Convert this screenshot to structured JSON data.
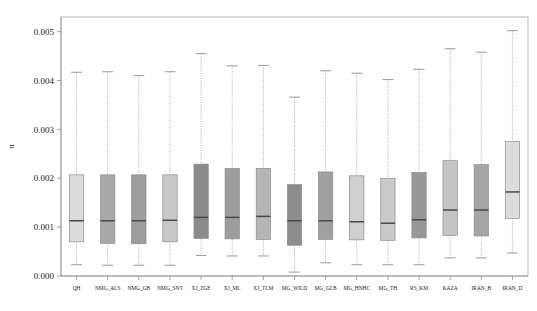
{
  "chart_data": {
    "type": "boxplot",
    "title": "",
    "xlabel": "",
    "ylabel": "π",
    "ylim": [
      0.0,
      0.0053
    ],
    "ytick_labels": [
      "0.000",
      "0.001",
      "0.002",
      "0.003",
      "0.004",
      "0.005"
    ],
    "ytick_values": [
      0.0,
      0.001,
      0.002,
      0.003,
      0.004,
      0.005
    ],
    "grid": false,
    "legend": "none",
    "categories": [
      "QH",
      "NMG_ALS",
      "NMG_GB",
      "NMG_SNT",
      "XJ_ZGE",
      "XJ_ML",
      "XJ_TLM",
      "MG_WILD",
      "MG_GLB",
      "MG_HNHC",
      "MG_TH",
      "RS_KM",
      "KAZA",
      "IRAN_B",
      "IRAN_D"
    ],
    "boxes": [
      {
        "name": "QH",
        "whisker_low": 0.00023,
        "q1": 0.0007,
        "median": 0.00113,
        "q3": 0.00207,
        "whisker_high": 0.00417,
        "fill": "#dcdcdc"
      },
      {
        "name": "NMG_ALS",
        "whisker_low": 0.00022,
        "q1": 0.00067,
        "median": 0.00113,
        "q3": 0.00207,
        "whisker_high": 0.00418,
        "fill": "#a8a8a8"
      },
      {
        "name": "NMG_GB",
        "whisker_low": 0.00022,
        "q1": 0.00066,
        "median": 0.00113,
        "q3": 0.00207,
        "whisker_high": 0.0041,
        "fill": "#9d9d9d"
      },
      {
        "name": "NMG_SNT",
        "whisker_low": 0.00022,
        "q1": 0.0007,
        "median": 0.00114,
        "q3": 0.00207,
        "whisker_high": 0.00418,
        "fill": "#c8c8c8"
      },
      {
        "name": "XJ_ZGE",
        "whisker_low": 0.00042,
        "q1": 0.00077,
        "median": 0.0012,
        "q3": 0.00229,
        "whisker_high": 0.00455,
        "fill": "#8a8a8a"
      },
      {
        "name": "XJ_ML",
        "whisker_low": 0.00041,
        "q1": 0.00076,
        "median": 0.0012,
        "q3": 0.0022,
        "whisker_high": 0.0043,
        "fill": "#9d9d9d"
      },
      {
        "name": "XJ_TLM",
        "whisker_low": 0.00041,
        "q1": 0.00075,
        "median": 0.00122,
        "q3": 0.0022,
        "whisker_high": 0.00431,
        "fill": "#b5b5b5"
      },
      {
        "name": "MG_WILD",
        "whisker_low": 8e-05,
        "q1": 0.00063,
        "median": 0.00113,
        "q3": 0.00187,
        "whisker_high": 0.00366,
        "fill": "#8c8c8c"
      },
      {
        "name": "MG_GLB",
        "whisker_low": 0.00027,
        "q1": 0.00075,
        "median": 0.00113,
        "q3": 0.00213,
        "whisker_high": 0.0042,
        "fill": "#a0a0a0"
      },
      {
        "name": "MG_HNHC",
        "whisker_low": 0.00023,
        "q1": 0.00074,
        "median": 0.00111,
        "q3": 0.00205,
        "whisker_high": 0.00415,
        "fill": "#cfcfcf"
      },
      {
        "name": "MG_TH",
        "whisker_low": 0.00023,
        "q1": 0.00073,
        "median": 0.00108,
        "q3": 0.002,
        "whisker_high": 0.00402,
        "fill": "#c9c9c9"
      },
      {
        "name": "RS_KM",
        "whisker_low": 0.00023,
        "q1": 0.00078,
        "median": 0.00115,
        "q3": 0.00212,
        "whisker_high": 0.00423,
        "fill": "#989898"
      },
      {
        "name": "KAZA",
        "whisker_low": 0.00037,
        "q1": 0.00083,
        "median": 0.00135,
        "q3": 0.00236,
        "whisker_high": 0.00465,
        "fill": "#c4c4c4"
      },
      {
        "name": "IRAN_B",
        "whisker_low": 0.00037,
        "q1": 0.00082,
        "median": 0.00135,
        "q3": 0.00228,
        "whisker_high": 0.00458,
        "fill": "#a5a5a5"
      },
      {
        "name": "IRAN_D",
        "whisker_low": 0.00047,
        "q1": 0.00118,
        "median": 0.00172,
        "q3": 0.00275,
        "whisker_high": 0.00502,
        "fill": "#dcdcdc"
      }
    ]
  },
  "axes": {
    "y_axis_title": "π",
    "panel_background": "#ffffff",
    "border_color": "#b0b0b0"
  }
}
